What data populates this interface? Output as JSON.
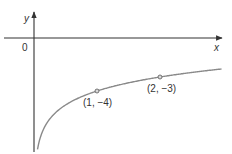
{
  "chart_data": {
    "type": "line",
    "title": "",
    "xlabel": "x",
    "ylabel": "y",
    "origin_label": "0",
    "grid": false,
    "legend": null,
    "function_shape": "logarithmic, vertical asymptote at x = 0, increasing",
    "series": [
      {
        "name": "curve",
        "x": [
          0.06,
          0.1,
          0.25,
          0.5,
          1,
          2,
          3
        ],
        "y": [
          -8.06,
          -7.32,
          -6,
          -5,
          -4,
          -3,
          -2.42
        ]
      }
    ],
    "points": [
      {
        "x": 1,
        "y": -4,
        "label": "(1, −4)"
      },
      {
        "x": 2,
        "y": -3,
        "label": "(2, −3)"
      }
    ],
    "annotations": [
      "(1, −4)",
      "(2, −3)"
    ]
  },
  "labels": {
    "x_axis": "x",
    "y_axis": "y",
    "origin": "0",
    "point1": "(1, −4)",
    "point2": "(2, −3)"
  },
  "colors": {
    "axis": "#333333",
    "curve": "#8a8a8a",
    "point_fill": "#d8d8d8"
  }
}
